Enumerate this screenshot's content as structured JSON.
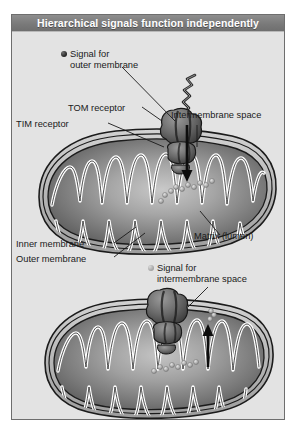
{
  "figure": {
    "title": "Hierarchical signals function independently",
    "panel_background": "#e3e3e3",
    "title_bar_color": "#7a7a7a",
    "title_text_color": "#ffffff",
    "border_color": "#6e6e6e"
  },
  "labels": {
    "signal_outer_line1": "Signal for",
    "signal_outer_line2": "outer membrane",
    "tom_receptor": "TOM receptor",
    "tim_receptor": "TIM receptor",
    "intermembrane_space": "Intermembrane space",
    "matrix": "Matrix (lumen)",
    "inner_membrane": "Inner membrane",
    "outer_membrane": "Outer membrane",
    "signal_ims_line1": "Signal for",
    "signal_ims_line2": "intermembrane space"
  },
  "legend": {
    "outer_membrane_signal_color": "#1f1f1f",
    "intermembrane_signal_color": "#a8a8a8"
  },
  "diagram": {
    "organelle": "mitochondrion",
    "panels": [
      {
        "name": "upper-mitochondrion",
        "signal_type": "outer membrane signal",
        "arrow_direction": "down",
        "description": "Precursor protein with dark outer-membrane signal engages TOM receptor and TIM receptor; chain translocates inward."
      },
      {
        "name": "lower-mitochondrion",
        "signal_type": "intermembrane space signal",
        "arrow_direction": "up",
        "description": "Precursor protein bearing intermembrane-space signal is redirected from the matrix back to the intermembrane space."
      }
    ],
    "membrane_stroke": "#1c1c1c",
    "cristae_stroke": "#ffffff",
    "matrix_fill_dark": "#4a4a4a",
    "matrix_fill_light": "#bdbdbd"
  }
}
